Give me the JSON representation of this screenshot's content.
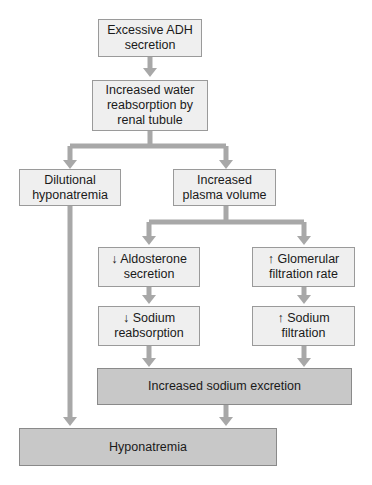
{
  "diagram": {
    "type": "flowchart",
    "colors": {
      "box_fill": "#efefef",
      "box_fill_dark": "#c8c8c8",
      "connector": "#a8a8a8",
      "border": "#9a9a9a"
    },
    "nodes": {
      "adh": {
        "label": "Excessive ADH\nsecretion"
      },
      "water": {
        "label": "Increased water\nreabsorption by\nrenal tubule"
      },
      "dilutional": {
        "label": "Dilutional\nhyponatremia"
      },
      "plasma": {
        "label": "Increased\nplasma volume"
      },
      "aldosterone": {
        "label": "↓ Aldosterone\nsecretion"
      },
      "gfr": {
        "label": "↑ Glomerular\nfiltration rate"
      },
      "na_reabs": {
        "label": "↓ Sodium\nreabsorption"
      },
      "na_filt": {
        "label": "↑ Sodium\nfiltration"
      },
      "excretion": {
        "label": "Increased sodium excretion"
      },
      "hyponatremia": {
        "label": "Hyponatremia"
      }
    },
    "edges": [
      [
        "adh",
        "water"
      ],
      [
        "water",
        "dilutional"
      ],
      [
        "water",
        "plasma"
      ],
      [
        "plasma",
        "aldosterone"
      ],
      [
        "plasma",
        "gfr"
      ],
      [
        "aldosterone",
        "na_reabs"
      ],
      [
        "gfr",
        "na_filt"
      ],
      [
        "na_reabs",
        "excretion"
      ],
      [
        "na_filt",
        "excretion"
      ],
      [
        "excretion",
        "hyponatremia"
      ],
      [
        "dilutional",
        "hyponatremia"
      ]
    ]
  }
}
